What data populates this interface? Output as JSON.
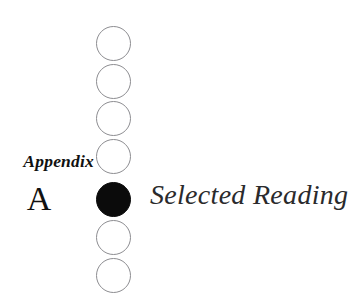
{
  "page": {
    "background_color": "#ffffff",
    "width": 351,
    "height": 308
  },
  "appendix": {
    "label": "Appendix",
    "letter": "A"
  },
  "title": {
    "text": "Selected Reading"
  },
  "bullet_column": {
    "center_x": 113,
    "diameter": 35,
    "outline_color": "#8d8d91",
    "fill_color": "#0b0b0b",
    "active_index": 4,
    "items": [
      {
        "index": 0,
        "top": 26,
        "state": "hollow"
      },
      {
        "index": 1,
        "top": 64,
        "state": "hollow"
      },
      {
        "index": 2,
        "top": 101,
        "state": "hollow"
      },
      {
        "index": 3,
        "top": 139,
        "state": "hollow"
      },
      {
        "index": 4,
        "top": 182,
        "state": "filled"
      },
      {
        "index": 5,
        "top": 220,
        "state": "hollow"
      },
      {
        "index": 6,
        "top": 258,
        "state": "hollow"
      }
    ]
  }
}
